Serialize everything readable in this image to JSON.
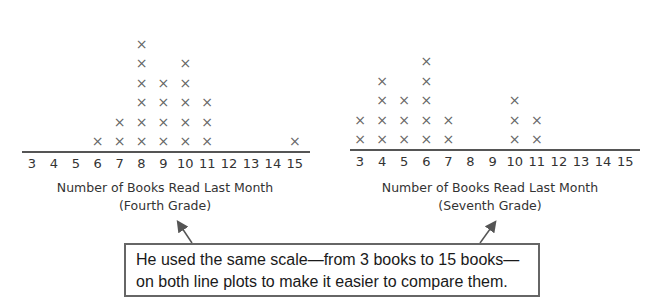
{
  "chart_data": [
    {
      "type": "line_plot",
      "title": "",
      "xlabel": "Number of Books Read Last Month",
      "subtitle": "(Fourth Grade)",
      "categories": [
        3,
        4,
        5,
        6,
        7,
        8,
        9,
        10,
        11,
        12,
        13,
        14,
        15
      ],
      "values": [
        0,
        0,
        0,
        1,
        2,
        6,
        4,
        5,
        3,
        0,
        0,
        0,
        1
      ],
      "xlim": [
        3,
        15
      ],
      "marker": "X",
      "grid": false
    },
    {
      "type": "line_plot",
      "title": "",
      "xlabel": "Number of Books Read Last Month",
      "subtitle": "(Seventh Grade)",
      "categories": [
        3,
        4,
        5,
        6,
        7,
        8,
        9,
        10,
        11,
        12,
        13,
        14,
        15
      ],
      "values": [
        2,
        4,
        3,
        5,
        2,
        0,
        0,
        3,
        2,
        0,
        0,
        0,
        0
      ],
      "xlim": [
        3,
        15
      ],
      "marker": "X",
      "grid": false
    }
  ],
  "plots": {
    "fourth": {
      "axis_title": "Number of Books Read Last Month",
      "grade_label": "(Fourth Grade)"
    },
    "seventh": {
      "axis_title": "Number of Books Read Last Month",
      "grade_label": "(Seventh Grade)"
    }
  },
  "callout": {
    "line1": "He used the same scale—from 3 books to 15 books—",
    "line2": "on both line plots to make it easier to compare them."
  },
  "marker_glyph": "×",
  "colors": {
    "marker": "#666666",
    "axis": "#555555",
    "text": "#333333"
  }
}
